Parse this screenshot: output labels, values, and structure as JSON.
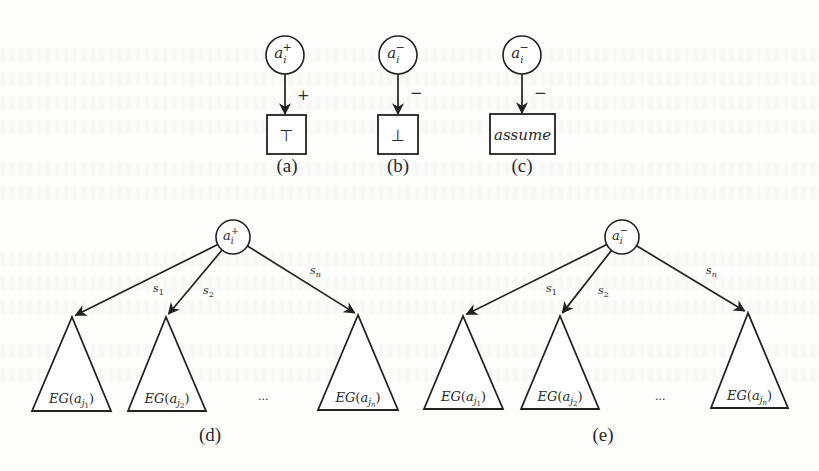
{
  "figure": {
    "colors": {
      "ink": "#222222",
      "paper": "#fdfdfc"
    },
    "panels": {
      "a": {
        "caption": "(a)",
        "caption_pos": [
          287,
          172
        ],
        "node": {
          "base": "a",
          "sub": "i",
          "sup": "+",
          "cx": 285,
          "cy": 55,
          "r": 19
        },
        "edge_label": "+",
        "edge_label_pos": [
          297,
          100
        ],
        "leaf": {
          "label": "⊤",
          "x": 267,
          "y": 115,
          "w": 39,
          "h": 39,
          "italic": false
        }
      },
      "b": {
        "caption": "(b)",
        "caption_pos": [
          398,
          172
        ],
        "node": {
          "base": "a",
          "sub": "i",
          "sup": "−",
          "cx": 398,
          "cy": 55,
          "r": 19
        },
        "edge_label": "−",
        "edge_label_pos": [
          410,
          98
        ],
        "leaf": {
          "label": "⊥",
          "x": 378,
          "y": 115,
          "w": 40,
          "h": 39,
          "italic": false
        }
      },
      "c": {
        "caption": "(c)",
        "caption_pos": [
          522,
          172
        ],
        "node": {
          "base": "a",
          "sub": "i",
          "sup": "−",
          "cx": 522,
          "cy": 55,
          "r": 19
        },
        "edge_label": "−",
        "edge_label_pos": [
          534,
          98
        ],
        "leaf": {
          "label": "assume",
          "x": 490,
          "y": 114,
          "w": 65,
          "h": 40,
          "italic": true
        }
      },
      "d": {
        "caption": "(d)",
        "caption_pos": [
          210,
          441
        ],
        "root": {
          "base": "a",
          "sub": "i",
          "sup": "+",
          "cx": 233,
          "cy": 237,
          "r": 17
        },
        "ellipsis": "...",
        "ellipsis_pos": [
          258,
          400
        ],
        "children": [
          {
            "edge_label": "s",
            "edge_sub": "1",
            "label_pos": [
              153,
              292
            ],
            "label": "EG",
            "arg_base": "a",
            "arg_sub": "j",
            "arg_subsub": "1",
            "apex": [
              72,
              317
            ],
            "base_left": 32,
            "base_right": 111,
            "base_y": 411
          },
          {
            "edge_label": "s",
            "edge_sub": "2",
            "label_pos": [
              203,
              294
            ],
            "label": "EG",
            "arg_base": "a",
            "arg_sub": "j",
            "arg_subsub": "2",
            "apex": [
              166,
              317
            ],
            "base_left": 128,
            "base_right": 206,
            "base_y": 411
          },
          {
            "edge_label": "s",
            "edge_sub": "n",
            "label_pos": [
              310,
              274
            ],
            "label": "EG",
            "arg_base": "a",
            "arg_sub": "j",
            "arg_subsub": "n",
            "apex": [
              358,
              315
            ],
            "base_left": 318,
            "base_right": 398,
            "base_y": 410
          }
        ]
      },
      "e": {
        "caption": "(e)",
        "caption_pos": [
          603,
          441
        ],
        "root": {
          "base": "a",
          "sub": "i",
          "sup": "−",
          "cx": 622,
          "cy": 237,
          "r": 17
        },
        "ellipsis": "...",
        "ellipsis_pos": [
          655,
          400
        ],
        "children": [
          {
            "edge_label": "s",
            "edge_sub": "1",
            "label_pos": [
              546,
              292
            ],
            "label": "EG",
            "arg_base": "a",
            "arg_sub": "j",
            "arg_subsub": "1",
            "apex": [
              463,
              316
            ],
            "base_left": 424,
            "base_right": 503,
            "base_y": 409
          },
          {
            "edge_label": "s",
            "edge_sub": "2",
            "label_pos": [
              598,
              294
            ],
            "label": "EG",
            "arg_base": "a",
            "arg_sub": "j",
            "arg_subsub": "2",
            "apex": [
              560,
              316
            ],
            "base_left": 521,
            "base_right": 599,
            "base_y": 409
          },
          {
            "edge_label": "s",
            "edge_sub": "n",
            "label_pos": [
              706,
              274
            ],
            "label": "EG",
            "arg_base": "a",
            "arg_sub": "j",
            "arg_subsub": "n",
            "apex": [
              748,
              313
            ],
            "base_left": 711,
            "base_right": 788,
            "base_y": 408
          }
        ]
      }
    }
  }
}
